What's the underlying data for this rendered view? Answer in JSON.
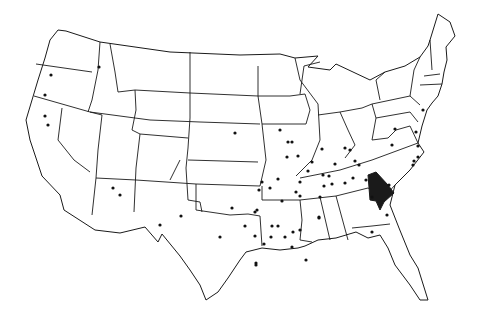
{
  "map": {
    "title": "United States map with marked locations",
    "colors": {
      "border": "#1a1a1a",
      "background": "#ffffff",
      "dot": "#111111",
      "highlight": "#1a1a1a"
    },
    "highlighted_region": {
      "label": "Northeast Georgia region",
      "points": "368,175 376,172 388,185 394,193 384,202 380,210 376,201 370,200"
    },
    "dots": [
      [
        51,
        75
      ],
      [
        45,
        95
      ],
      [
        45,
        116
      ],
      [
        48,
        125
      ],
      [
        99,
        67
      ],
      [
        113,
        188
      ],
      [
        120,
        195
      ],
      [
        160,
        225
      ],
      [
        181,
        216
      ],
      [
        220,
        237
      ],
      [
        235,
        133
      ],
      [
        280,
        130
      ],
      [
        288,
        142
      ],
      [
        292,
        142
      ],
      [
        287,
        157
      ],
      [
        298,
        156
      ],
      [
        312,
        162
      ],
      [
        308,
        171
      ],
      [
        324,
        186
      ],
      [
        332,
        184
      ],
      [
        300,
        182
      ],
      [
        322,
        149
      ],
      [
        278,
        179
      ],
      [
        296,
        192
      ],
      [
        300,
        196
      ],
      [
        262,
        182
      ],
      [
        259,
        190
      ],
      [
        270,
        188
      ],
      [
        282,
        201
      ],
      [
        255,
        212
      ],
      [
        232,
        208
      ],
      [
        245,
        226
      ],
      [
        257,
        210
      ],
      [
        272,
        226
      ],
      [
        278,
        226
      ],
      [
        285,
        237
      ],
      [
        271,
        237
      ],
      [
        264,
        244
      ],
      [
        292,
        247
      ],
      [
        293,
        232
      ],
      [
        323,
        175
      ],
      [
        320,
        197
      ],
      [
        329,
        176
      ],
      [
        335,
        164
      ],
      [
        345,
        148
      ],
      [
        350,
        150
      ],
      [
        345,
        183
      ],
      [
        355,
        161
      ],
      [
        300,
        230
      ],
      [
        319,
        218
      ],
      [
        353,
        178
      ],
      [
        366,
        180
      ],
      [
        389,
        185
      ],
      [
        372,
        197
      ],
      [
        387,
        215
      ],
      [
        372,
        232
      ],
      [
        255,
        236
      ],
      [
        306,
        260
      ],
      [
        395,
        129
      ],
      [
        416,
        132
      ],
      [
        418,
        146
      ],
      [
        418,
        157
      ],
      [
        414,
        161
      ],
      [
        413,
        165
      ],
      [
        423,
        110
      ],
      [
        319,
        217
      ],
      [
        256,
        263
      ],
      [
        256,
        265
      ],
      [
        392,
        145
      ],
      [
        359,
        165
      ]
    ]
  }
}
